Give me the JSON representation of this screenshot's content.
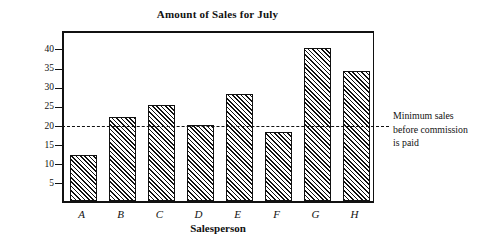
{
  "chart_data": {
    "type": "bar",
    "title": "Amount of Sales for July",
    "xlabel": "Salesperson",
    "ylabel": "Sales (in thousands of dollars)",
    "categories": [
      "A",
      "B",
      "C",
      "D",
      "E",
      "F",
      "G",
      "H"
    ],
    "values": [
      12,
      22,
      25,
      20,
      28,
      18,
      40,
      34
    ],
    "ylim": [
      0,
      45
    ],
    "yticks": [
      5,
      10,
      15,
      20,
      25,
      30,
      35,
      40
    ],
    "ytick_labels": [
      "5",
      "10",
      "15",
      "20",
      "25",
      "30",
      "35",
      "40"
    ],
    "grid": false,
    "legend": null,
    "bar_fill": "diagonal-hatch",
    "bar_color": "#111111",
    "annotations": [
      {
        "type": "threshold-line",
        "value": 20,
        "style": "dashed",
        "text_lines": [
          "Minimum sales",
          "before commission",
          "is paid"
        ]
      }
    ]
  },
  "annotation": {
    "line1": "Minimum sales",
    "line2": "before commission",
    "line3": "is paid"
  }
}
